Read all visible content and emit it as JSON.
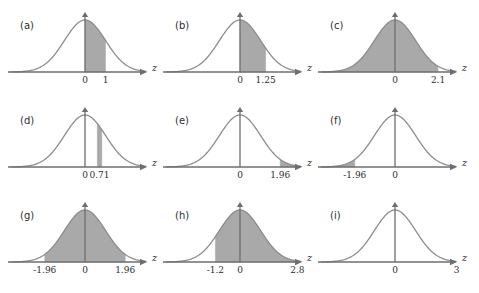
{
  "figure": {
    "axis_label": "z",
    "curve_color": "#8c8c8c",
    "shade_color": "#a9a9a9",
    "axis_color": "#6e6e6e",
    "text_color": "#2e2e2e",
    "background": "#ffffff",
    "rows": 3,
    "cols": 3
  },
  "chart_data": {
    "type": "area",
    "xlabel": "z",
    "ylabel": "",
    "xlim": [
      -4,
      4
    ],
    "ylim": [
      0,
      0.42
    ],
    "grid": false,
    "legend": "none",
    "distribution": "standard normal (mean 0, sd 1)",
    "panels": [
      {
        "letter": "(a)",
        "shade_from": 0,
        "shade_to": 1,
        "shade_type": "between",
        "tick_labels": [
          "0",
          "1"
        ],
        "tick_values": [
          0,
          1
        ]
      },
      {
        "letter": "(b)",
        "shade_from": 0,
        "shade_to": 1.25,
        "shade_type": "between",
        "tick_labels": [
          "0",
          "1.25"
        ],
        "tick_values": [
          0,
          1.25
        ]
      },
      {
        "letter": "(c)",
        "shade_from": -4,
        "shade_to": 2.1,
        "shade_type": "left-tail",
        "tick_labels": [
          "0",
          "2.1"
        ],
        "tick_values": [
          0,
          2.1
        ]
      },
      {
        "letter": "(d)",
        "shade_from": 0.6,
        "shade_to": 0.82,
        "shade_type": "narrow-strip",
        "tick_labels": [
          "0",
          "0.71"
        ],
        "tick_values": [
          0,
          0.71
        ]
      },
      {
        "letter": "(e)",
        "shade_from": 1.96,
        "shade_to": 4,
        "shade_type": "right-tail",
        "tick_labels": [
          "0",
          "1.96"
        ],
        "tick_values": [
          0,
          1.96
        ]
      },
      {
        "letter": "(f)",
        "shade_from": -4,
        "shade_to": -1.96,
        "shade_type": "left-tail",
        "tick_labels": [
          "-1.96",
          "0"
        ],
        "tick_values": [
          -1.96,
          0
        ]
      },
      {
        "letter": "(g)",
        "shade_from": -1.96,
        "shade_to": 1.96,
        "shade_type": "between",
        "tick_labels": [
          "-1.96",
          "0",
          "1.96"
        ],
        "tick_values": [
          -1.96,
          0,
          1.96
        ]
      },
      {
        "letter": "(h)",
        "shade_from": -1.2,
        "shade_to": 2.8,
        "shade_type": "between",
        "tick_labels": [
          "-1.2",
          "0",
          "2.8"
        ],
        "tick_values": [
          -1.2,
          0,
          2.8
        ]
      },
      {
        "letter": "(i)",
        "shade_from": null,
        "shade_to": null,
        "shade_type": "none",
        "tick_labels": [
          "0",
          "3"
        ],
        "tick_values": [
          0,
          3
        ]
      }
    ]
  }
}
